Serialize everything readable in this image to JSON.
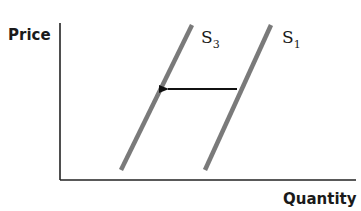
{
  "diagram": {
    "type": "supply-shift",
    "y_axis_label": "Price",
    "x_axis_label": "Quantity",
    "curves": [
      {
        "name": "S",
        "subscript": "3",
        "color": "#7a7a7a",
        "x1": 121,
        "y1": 170,
        "x2": 192,
        "y2": 25
      },
      {
        "name": "S",
        "subscript": "1",
        "color": "#7a7a7a",
        "x1": 205,
        "y1": 170,
        "x2": 271,
        "y2": 25
      }
    ],
    "shift_arrow": {
      "direction": "left",
      "from": "S1",
      "to": "S3",
      "color": "#111111"
    },
    "axis_color": "#222222"
  }
}
